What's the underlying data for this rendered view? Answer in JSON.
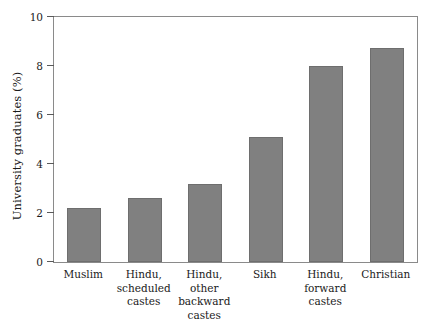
{
  "chart_data": {
    "type": "bar",
    "title": "",
    "subtitle": "",
    "xlabel": "",
    "ylabel": "University graduates (%)",
    "categories": [
      "Muslim",
      "Hindu, scheduled castes",
      "Hindu, other backward castes",
      "Sikh",
      "Hindu, forward castes",
      "Christian"
    ],
    "category_lines": [
      [
        "Muslim"
      ],
      [
        "Hindu,",
        "scheduled",
        "castes"
      ],
      [
        "Hindu,",
        "other",
        "backward",
        "castes"
      ],
      [
        "Sikh"
      ],
      [
        "Hindu,",
        "forward",
        "castes"
      ],
      [
        "Christian"
      ]
    ],
    "values": [
      2.2,
      2.6,
      3.2,
      5.1,
      8.0,
      8.75
    ],
    "ylim": [
      0,
      10
    ],
    "yticks": [
      0,
      2,
      4,
      6,
      8,
      10
    ],
    "ytick_labels": [
      "0",
      "2",
      "4",
      "6",
      "8",
      "10"
    ],
    "grid": false,
    "legend": false,
    "legend_position": "none",
    "bar_color": "#808080",
    "bar_edge_color": "#6e6e6e",
    "axis_color": "#8a8a8a",
    "background_color": "#ffffff"
  }
}
